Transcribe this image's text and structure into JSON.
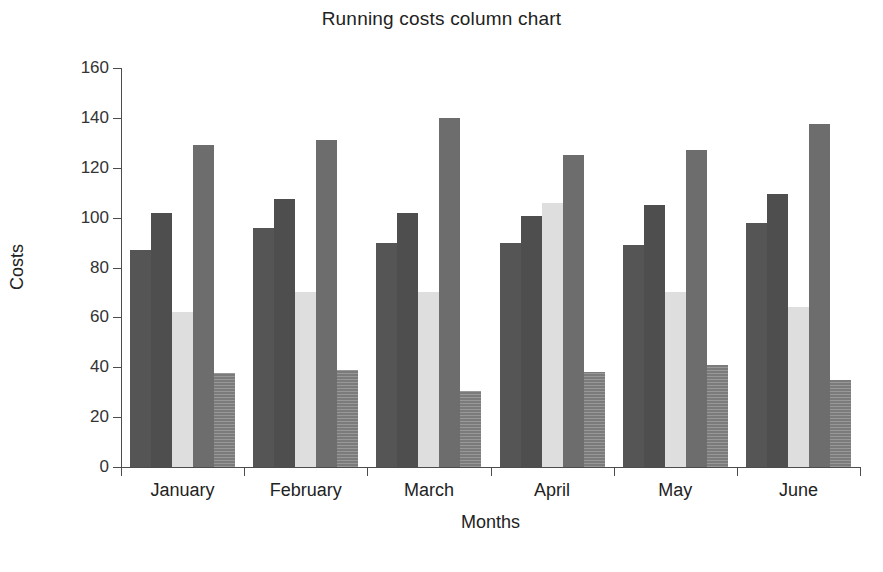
{
  "chart_data": {
    "type": "bar",
    "title": "Running costs column chart",
    "xlabel": "Months",
    "ylabel": "Costs",
    "categories": [
      "January",
      "February",
      "March",
      "April",
      "May",
      "June"
    ],
    "ylim": [
      0,
      160
    ],
    "yticks": [
      0,
      20,
      40,
      60,
      80,
      100,
      120,
      140,
      160
    ],
    "grid": false,
    "legend": "none",
    "series": [
      {
        "name": "Series 1",
        "color": "#555555",
        "values": [
          87,
          96,
          90,
          90,
          89,
          98
        ]
      },
      {
        "name": "Series 2",
        "color": "#4e4e4e",
        "values": [
          102,
          107.5,
          102,
          100.5,
          105,
          109.5
        ]
      },
      {
        "name": "Series 3",
        "color": "#dedede",
        "values": [
          62,
          70,
          70,
          106,
          70,
          64
        ]
      },
      {
        "name": "Series 4",
        "color": "#6d6d6d",
        "values": [
          129,
          131,
          140,
          125,
          127,
          137.5
        ]
      },
      {
        "name": "Series 5",
        "color": "#7b7b7b",
        "values": [
          37.5,
          39,
          30.5,
          38,
          41,
          35
        ]
      }
    ]
  },
  "caption": ""
}
